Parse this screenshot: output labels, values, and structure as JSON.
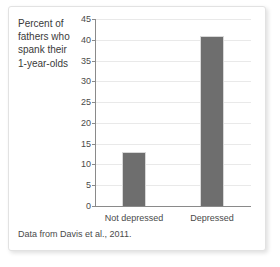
{
  "chart_data": {
    "type": "bar",
    "title": "Percent of fathers who spank their 1-year-olds",
    "xlabel": "",
    "ylabel": "Percent of fathers who spank their 1-year-olds",
    "categories": [
      "Not depressed",
      "Depressed"
    ],
    "values": [
      13,
      41
    ],
    "ylim": [
      0,
      45
    ],
    "y_ticks": [
      0,
      5,
      10,
      15,
      20,
      25,
      30,
      35,
      40,
      45
    ],
    "y_tick_labels": [
      "0",
      "5",
      "10",
      "15",
      "20",
      "25",
      "30",
      "35",
      "40",
      "45"
    ],
    "grid": true,
    "legend": false,
    "bar_color": "#6e6e6e",
    "axis_color": "#8a8a8a",
    "grid_color": "#e9e9e9",
    "caption": "Data from Davis et al., 2011."
  },
  "figure": {
    "title_text": "Percent of\nfathers who\nspank their\n1-year-olds",
    "caption": "Data from Davis et al., 2011."
  }
}
